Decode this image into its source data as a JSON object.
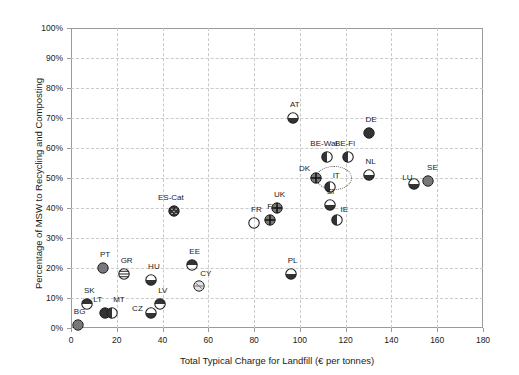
{
  "chart_data": {
    "type": "scatter",
    "title": "",
    "xlabel": "Total Typical Charge for Landfill (€ per tonnes)",
    "ylabel": "Percentage of MSW to Recycling and Composting",
    "xlim": [
      0,
      180
    ],
    "ylim": [
      0,
      100
    ],
    "xticks": [
      "0",
      "20",
      "40",
      "60",
      "80",
      "100",
      "120",
      "140",
      "160",
      "180"
    ],
    "yticks": [
      "0%",
      "10%",
      "20%",
      "30%",
      "40%",
      "50%",
      "60%",
      "70%",
      "80%",
      "90%",
      "100%"
    ],
    "grid": true,
    "legend": "none",
    "annotation": "dotted-ellipse-around-DK-and-IT",
    "points": [
      {
        "label": "BG",
        "x": 3,
        "y": 1,
        "marker": "solid-gray",
        "lx": -4,
        "ly": -17
      },
      {
        "label": "SK",
        "x": 7,
        "y": 8,
        "marker": "top-half",
        "lx": -3,
        "ly": -17
      },
      {
        "label": "PT",
        "x": 14,
        "y": 20,
        "marker": "solid-gray",
        "lx": -3,
        "ly": -17
      },
      {
        "label": "LT",
        "x": 15,
        "y": 5,
        "marker": "solid-dark",
        "lx": -12,
        "ly": -17
      },
      {
        "label": "MT",
        "x": 18,
        "y": 5,
        "marker": "left-half",
        "lx": 1,
        "ly": -17
      },
      {
        "label": "GR",
        "x": 23,
        "y": 18,
        "marker": "striped",
        "lx": -3,
        "ly": -17
      },
      {
        "label": "CZ",
        "x": 35,
        "y": 5,
        "marker": "bottom-half",
        "lx": -19,
        "ly": -8
      },
      {
        "label": "HU",
        "x": 35,
        "y": 16,
        "marker": "bottom-half",
        "lx": -3,
        "ly": -17
      },
      {
        "label": "LV",
        "x": 39,
        "y": 8,
        "marker": "top-half",
        "lx": -2,
        "ly": -17
      },
      {
        "label": "ES-Cat",
        "x": 45,
        "y": 39,
        "marker": "dark-dotted",
        "lx": -16,
        "ly": -17
      },
      {
        "label": "EE",
        "x": 53,
        "y": 21,
        "marker": "top-half",
        "lx": -3,
        "ly": -17
      },
      {
        "label": "CY",
        "x": 56,
        "y": 14,
        "marker": "light-hatch",
        "lx": 1,
        "ly": -16
      },
      {
        "label": "FR",
        "x": 80,
        "y": 35,
        "marker": "open",
        "lx": -3,
        "ly": -17
      },
      {
        "label": "FI",
        "x": 87,
        "y": 36,
        "marker": "cross-hatch",
        "lx": -3,
        "ly": -17
      },
      {
        "label": "UK",
        "x": 90,
        "y": 40,
        "marker": "cross-hatch",
        "lx": -3,
        "ly": -17
      },
      {
        "label": "PL",
        "x": 96,
        "y": 18,
        "marker": "bottom-half",
        "lx": -3,
        "ly": -17
      },
      {
        "label": "AT",
        "x": 97,
        "y": 70,
        "marker": "bottom-half",
        "lx": -3,
        "ly": -17
      },
      {
        "label": "DK",
        "x": 107,
        "y": 50,
        "marker": "cross-hatch",
        "lx": -17,
        "ly": -13
      },
      {
        "label": "IT",
        "x": 113,
        "y": 47,
        "marker": "left-half",
        "lx": 3,
        "ly": -15
      },
      {
        "label": "SI",
        "x": 113,
        "y": 41,
        "marker": "bottom-half",
        "lx": -3,
        "ly": -17
      },
      {
        "label": "IE",
        "x": 116,
        "y": 36,
        "marker": "left-half",
        "lx": 4,
        "ly": -14
      },
      {
        "label": "BE-Wal",
        "x": 112,
        "y": 57,
        "marker": "left-half",
        "lx": -17,
        "ly": -17
      },
      {
        "label": "BE-Fl",
        "x": 121,
        "y": 57,
        "marker": "left-half",
        "lx": -13,
        "ly": -17
      },
      {
        "label": "NL",
        "x": 130,
        "y": 51,
        "marker": "bottom-half",
        "lx": -3,
        "ly": -17
      },
      {
        "label": "DE",
        "x": 130,
        "y": 65,
        "marker": "solid-dark",
        "lx": -3,
        "ly": -17
      },
      {
        "label": "LU",
        "x": 150,
        "y": 48,
        "marker": "bottom-half",
        "lx": -12,
        "ly": -10
      },
      {
        "label": "SE",
        "x": 156,
        "y": 49,
        "marker": "solid-gray",
        "lx": -1,
        "ly": -17
      }
    ]
  }
}
